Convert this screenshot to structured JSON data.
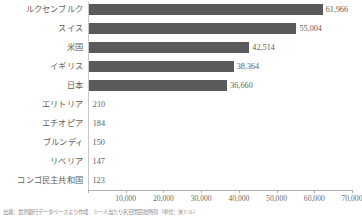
{
  "chart_data": {
    "type": "bar",
    "orientation": "horizontal",
    "title": "",
    "xlabel": "",
    "ylabel": "",
    "xlim": [
      0,
      70000
    ],
    "grid": false,
    "legend": null,
    "categories": [
      "ルクセンブルク",
      "スイス",
      "米国",
      "イギリス",
      "日本",
      "エリトリア",
      "エチオピア",
      "ブルンディ",
      "リベリア",
      "コンゴ民主共和国"
    ],
    "values": [
      61966,
      55004,
      42514,
      38364,
      36660,
      210,
      184,
      150,
      147,
      123
    ],
    "value_labels": [
      "61,966",
      "55,004",
      "42,514",
      "38,364",
      "36,660",
      "210",
      "184",
      "150",
      "147",
      "123"
    ],
    "xticks": [
      0,
      10000,
      20000,
      30000,
      40000,
      50000,
      60000,
      70000
    ],
    "xtick_labels": [
      "",
      "10,000",
      "20,000",
      "30,000",
      "40,000",
      "50,000",
      "60,000",
      "70,000"
    ]
  },
  "footnote": {
    "text": "出典：世界銀行データベースより作成　※一人当たり名目国民総所得（単位：米ドル）"
  },
  "colors": {
    "bar": "#5a5a5a",
    "text": "#5e5e5e",
    "axis": "#b0b0b0",
    "background": "#ffffff"
  }
}
